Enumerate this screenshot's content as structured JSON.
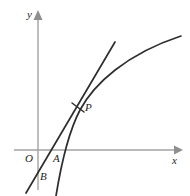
{
  "figure": {
    "background_color": "#ffffff",
    "curve_color": "#2e2e2e",
    "axis_color": "#a2a2a2",
    "label_color": "#1d1d1d"
  },
  "axes": {
    "x_label": "x",
    "y_label": "y",
    "origin_label": "O",
    "x_axis": {
      "start": [
        14,
        150
      ],
      "end": [
        181,
        150
      ],
      "arrow": "right"
    },
    "y_axis": {
      "start": [
        38,
        190
      ],
      "end": [
        38,
        12
      ],
      "arrow": "up"
    }
  },
  "points": [
    {
      "name": "O",
      "label": "O",
      "x": 38,
      "y": 150,
      "description": "origin"
    },
    {
      "name": "A",
      "label": "A",
      "x": 54,
      "y": 150,
      "description": "tangent line crosses x-axis"
    },
    {
      "name": "B",
      "label": "B",
      "x": 38,
      "y": 176,
      "description": "tangent line crosses y-axis"
    },
    {
      "name": "P",
      "label": "P",
      "x": 78,
      "y": 107,
      "description": "point of tangency on the curve, marked with a tick"
    }
  ],
  "curves": [
    {
      "name": "function-curve",
      "label": "",
      "type": "concave-increasing",
      "path": "M 56,196 C 61,165 68,133 80,110 C 94,84 126,54 181,36"
    },
    {
      "name": "tangent-line",
      "label": "",
      "type": "straight-line",
      "path": "M 26,193 L 115,42"
    }
  ],
  "tick_mark": {
    "name": "tangency-tick",
    "path": "M 72,103 L 84,112"
  },
  "chart_data": {
    "type": "line",
    "xlabel": "x",
    "ylabel": "y",
    "grid": false,
    "legend": false,
    "annotations": [
      "O",
      "A",
      "B",
      "P"
    ]
  }
}
